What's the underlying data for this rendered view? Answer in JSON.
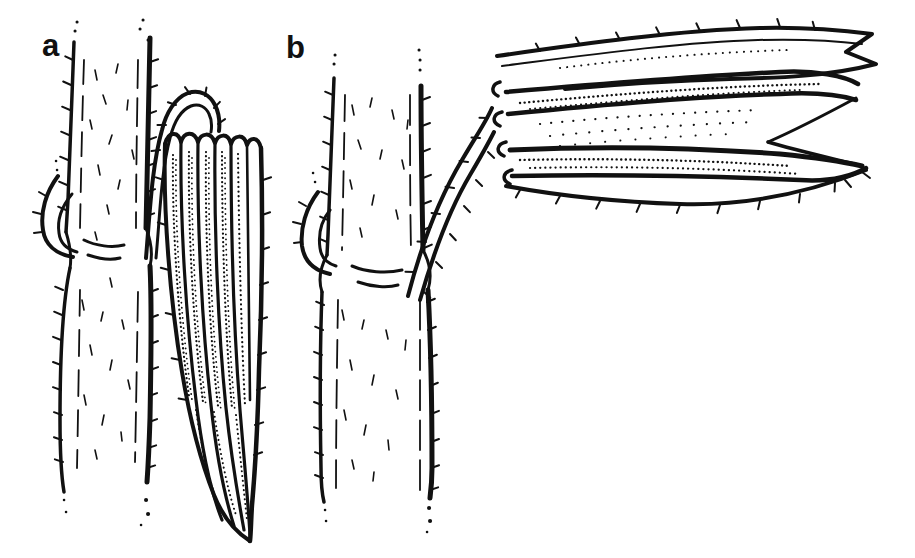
{
  "figure": {
    "panels": [
      {
        "label": "a"
      },
      {
        "label": "b"
      }
    ],
    "colors": {
      "ink": "#111111",
      "paper": "#ffffff"
    }
  }
}
